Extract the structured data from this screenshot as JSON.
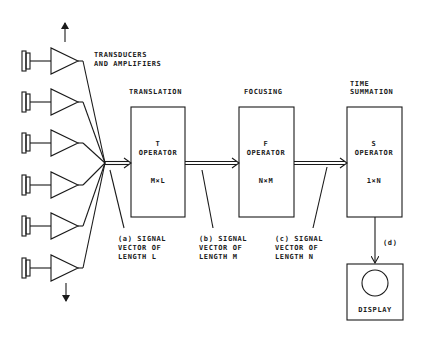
{
  "diagram": {
    "transducers": {
      "label_line1": "TRANSDUCERS",
      "label_line2": "AND AMPLIFIERS",
      "count": 6,
      "center_y": [
        61,
        102,
        143,
        185,
        226,
        268
      ]
    },
    "stages": [
      {
        "heading": "TRANSLATION",
        "heading2": "",
        "symbol": "T",
        "label": "OPERATOR",
        "dims": "M×L"
      },
      {
        "heading": "FOCUSING",
        "heading2": "",
        "symbol": "F",
        "label": "OPERATOR",
        "dims": "N×M"
      },
      {
        "heading": "TIME",
        "heading2": "SUMMATION",
        "symbol": "S",
        "label": "OPERATOR",
        "dims": "1×N"
      }
    ],
    "signals": [
      {
        "line1": "(a) SIGNAL",
        "line2": "VECTOR OF",
        "line3": "LENGTH L"
      },
      {
        "line1": "(b) SIGNAL",
        "line2": "VECTOR OF",
        "line3": "LENGTH M"
      },
      {
        "line1": "(c) SIGNAL",
        "line2": "VECTOR OF",
        "line3": "LENGTH N"
      }
    ],
    "output_label": "(d)",
    "display_label": "DISPLAY"
  }
}
